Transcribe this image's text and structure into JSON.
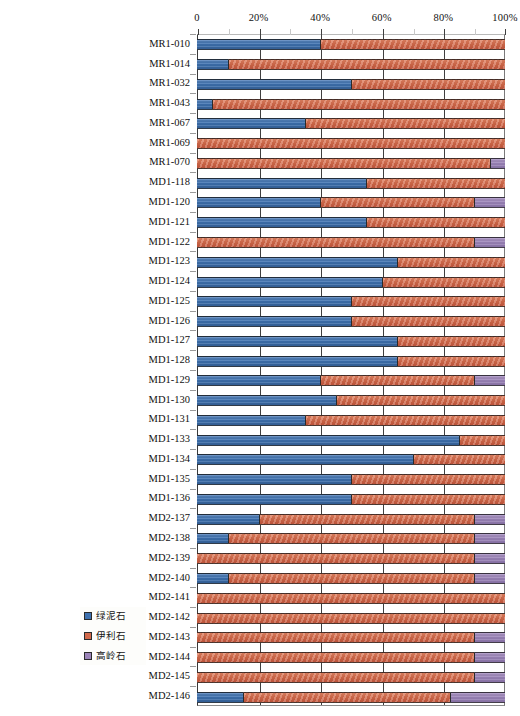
{
  "chart_data": {
    "type": "bar",
    "orientation": "horizontal",
    "stacked": true,
    "normalized_percent": true,
    "title": "",
    "xlabel": "",
    "ylabel": "",
    "xlim": [
      0,
      100
    ],
    "grid": true,
    "legend_position": "inside-bottom-left",
    "axis_ticks": [
      "0",
      "20%",
      "40%",
      "60%",
      "80%",
      "100%"
    ],
    "axis_tick_values": [
      0,
      20,
      40,
      60,
      80,
      100
    ],
    "minor_tick_values": [
      10,
      30,
      50,
      70,
      90
    ],
    "categories": [
      "MR1-010",
      "MR1-014",
      "MR1-032",
      "MR1-043",
      "MR1-067",
      "MR1-069",
      "MR1-070",
      "MD1-118",
      "MD1-120",
      "MD1-121",
      "MD1-122",
      "MD1-123",
      "MD1-124",
      "MD1-125",
      "MD1-126",
      "MD1-127",
      "MD1-128",
      "MD1-129",
      "MD1-130",
      "MD1-131",
      "MD1-133",
      "MD1-134",
      "MD1-135",
      "MD1-136",
      "MD2-137",
      "MD2-138",
      "MD2-139",
      "MD2-140",
      "MD2-141",
      "MD2-142",
      "MD2-143",
      "MD2-144",
      "MD2-145",
      "MD2-146"
    ],
    "series": [
      {
        "name": "绿泥石",
        "name_en": "chlorite",
        "color": "#3f72b0",
        "values": [
          40,
          10,
          50,
          5,
          35,
          0,
          0,
          55,
          40,
          55,
          0,
          65,
          60,
          50,
          50,
          65,
          65,
          40,
          45,
          35,
          85,
          70,
          50,
          50,
          20,
          10,
          0,
          10,
          0,
          0,
          0,
          0,
          0,
          15
        ]
      },
      {
        "name": "伊利石",
        "name_en": "illite",
        "color": "#d2694a",
        "values": [
          60,
          90,
          50,
          95,
          65,
          100,
          95,
          45,
          50,
          45,
          90,
          35,
          40,
          50,
          50,
          35,
          35,
          50,
          55,
          65,
          15,
          30,
          50,
          50,
          70,
          80,
          90,
          80,
          100,
          100,
          90,
          90,
          90,
          67
        ]
      },
      {
        "name": "高岭石",
        "name_en": "kaolinite",
        "color": "#9b84b8",
        "values": [
          0,
          0,
          0,
          0,
          0,
          0,
          5,
          0,
          10,
          0,
          10,
          0,
          0,
          0,
          0,
          0,
          0,
          10,
          0,
          0,
          0,
          0,
          0,
          0,
          10,
          10,
          10,
          10,
          0,
          0,
          10,
          10,
          10,
          18
        ]
      }
    ]
  },
  "legend": {
    "items": [
      {
        "label": "绿泥石",
        "color": "#3f72b0",
        "icon": "legend-swatch-chlorite"
      },
      {
        "label": "伊利石",
        "color": "#d2694a",
        "icon": "legend-swatch-illite"
      },
      {
        "label": "高岭石",
        "color": "#9b84b8",
        "icon": "legend-swatch-kaolinite"
      }
    ]
  }
}
